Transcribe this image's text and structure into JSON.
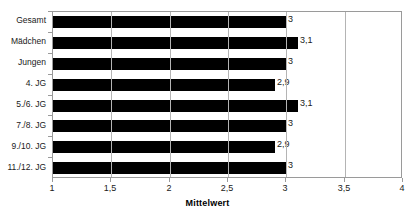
{
  "chart_data": {
    "type": "bar",
    "orientation": "horizontal",
    "title": "",
    "xlabel": "Mittelwert",
    "ylabel": "",
    "xlim": [
      1,
      4
    ],
    "xticks": [
      "1",
      "1,5",
      "2",
      "2,5",
      "3",
      "3,5",
      "4"
    ],
    "xtick_values": [
      1,
      1.5,
      2,
      2.5,
      3,
      3.5,
      4
    ],
    "grid": true,
    "grid_axis": "x",
    "legend": false,
    "bar_color": "#000000",
    "categories": [
      "Gesamt",
      "Mädchen",
      "Jungen",
      "4. JG",
      "5./6. JG",
      "7./8. JG",
      "9./10. JG",
      "11./12. JG"
    ],
    "values": [
      3,
      3.1,
      3,
      2.9,
      3.1,
      3,
      2.9,
      3
    ],
    "data_labels": [
      "3",
      "3,1",
      "3",
      "2,9",
      "3,1",
      "3",
      "2,9",
      "3"
    ]
  },
  "title_remnant": ""
}
